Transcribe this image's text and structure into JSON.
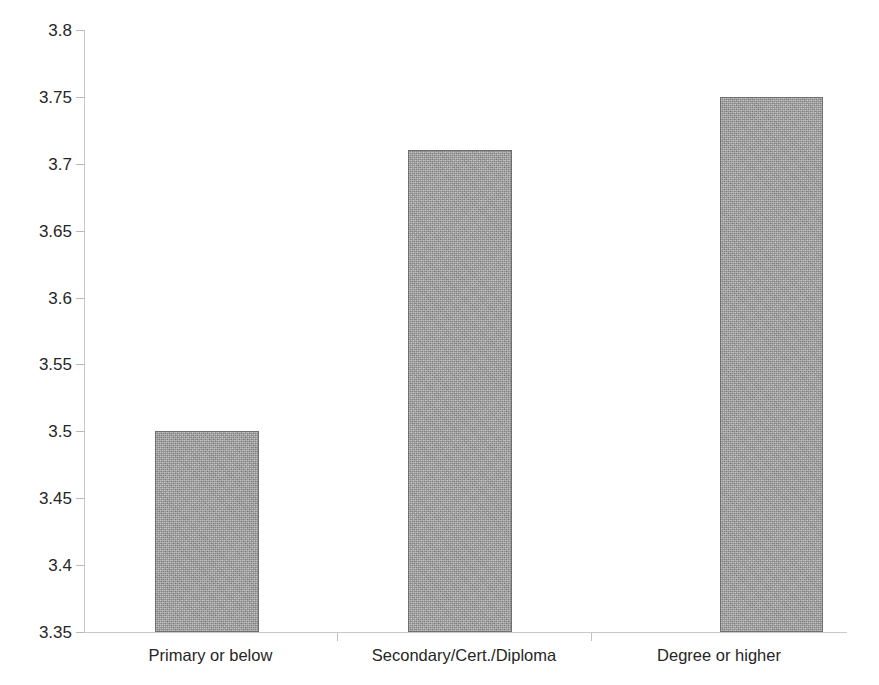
{
  "chart_data": {
    "type": "bar",
    "title": "",
    "subtitle": "",
    "xlabel": "",
    "ylabel": "",
    "categories": [
      "Primary or below",
      "Secondary/Cert./Diploma",
      "Degree or higher"
    ],
    "values": [
      3.5,
      3.71,
      3.75
    ],
    "series": [
      {
        "name": "",
        "values": [
          3.5,
          3.71,
          3.75
        ]
      }
    ],
    "ylim": [
      3.35,
      3.8
    ],
    "ytick_labels": [
      "3.8",
      "3.75",
      "3.7",
      "3.65",
      "3.6",
      "3.55",
      "3.5",
      "3.45",
      "3.4",
      "3.35"
    ],
    "ytick_values": [
      3.8,
      3.75,
      3.7,
      3.65,
      3.6,
      3.55,
      3.5,
      3.45,
      3.4,
      3.35
    ],
    "ytick_step": 0.05,
    "grid": false,
    "legend": false,
    "legend_position": "none",
    "annotations": [],
    "bar_color": "#a5a5a5",
    "bar_border_color": "#6f6f6f",
    "axis_color": "#c9c9c9",
    "background_color": "#ffffff",
    "text_color": "#262626"
  }
}
